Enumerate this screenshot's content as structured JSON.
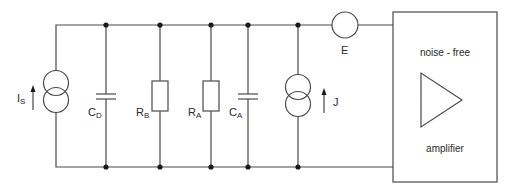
{
  "diagram": {
    "type": "circuit-schematic",
    "components": [
      {
        "id": "Is",
        "kind": "current-source",
        "label": "I",
        "sub": "S",
        "direction": "up"
      },
      {
        "id": "CD",
        "kind": "capacitor",
        "label": "C",
        "sub": "D"
      },
      {
        "id": "RB",
        "kind": "resistor",
        "label": "R",
        "sub": "B"
      },
      {
        "id": "RA",
        "kind": "resistor",
        "label": "R",
        "sub": "A"
      },
      {
        "id": "CA",
        "kind": "capacitor",
        "label": "C",
        "sub": "A"
      },
      {
        "id": "J",
        "kind": "noise-current-source",
        "label": "J",
        "sub": "",
        "direction": "up"
      },
      {
        "id": "E",
        "kind": "noise-voltage-source",
        "label": "E",
        "sub": ""
      }
    ],
    "amplifier": {
      "title": "noise - free",
      "subtitle": "amplifier"
    },
    "colors": {
      "wire": "#4a4a4a",
      "node": "#1a1a1a",
      "background": "#ffffff"
    }
  }
}
